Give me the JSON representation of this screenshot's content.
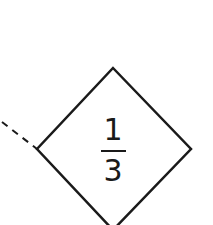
{
  "diagram": {
    "shape": "diamond",
    "stroke_color": "#1a1a1a",
    "background": "#ffffff",
    "vertices": {
      "top": [
        113,
        68
      ],
      "right": [
        191,
        149
      ],
      "bottom": [
        113,
        230
      ],
      "left": [
        37,
        149
      ]
    },
    "label": {
      "numerator": "1",
      "denominator": "3"
    },
    "connector": {
      "style": "dashed",
      "from": [
        2,
        122
      ],
      "to": [
        37,
        149
      ]
    }
  }
}
